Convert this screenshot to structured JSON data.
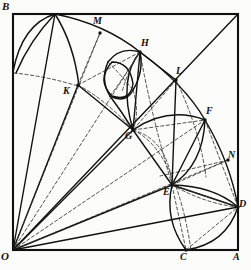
{
  "figure": {
    "background_color": "#fcfcfa",
    "stroke_color": "#111111",
    "dashed_color": "#333333",
    "square": {
      "origin_label": "O",
      "left": 13,
      "top": 14,
      "right": 238,
      "bottom": 250
    },
    "points": [
      {
        "id": "B",
        "label": "B",
        "x": 13,
        "y": 14,
        "lx": 2,
        "ly": 1,
        "size": 11
      },
      {
        "id": "M",
        "label": "M",
        "x": 100,
        "y": 33,
        "lx": 93,
        "ly": 16,
        "size": 10
      },
      {
        "id": "H",
        "label": "H",
        "x": 140,
        "y": 52,
        "lx": 141,
        "ly": 38,
        "size": 10
      },
      {
        "id": "L",
        "label": "L",
        "x": 176,
        "y": 80,
        "lx": 176,
        "ly": 66,
        "size": 10
      },
      {
        "id": "K",
        "label": "K",
        "x": 78,
        "y": 85,
        "lx": 63,
        "ly": 86,
        "size": 10
      },
      {
        "id": "F",
        "label": "F",
        "x": 205,
        "y": 120,
        "lx": 206,
        "ly": 106,
        "size": 10
      },
      {
        "id": "G",
        "label": "G",
        "x": 133,
        "y": 130,
        "lx": 125,
        "ly": 131,
        "size": 10
      },
      {
        "id": "N",
        "label": "N",
        "x": 228,
        "y": 160,
        "lx": 228,
        "ly": 150,
        "size": 10
      },
      {
        "id": "E",
        "label": "E",
        "x": 172,
        "y": 185,
        "lx": 163,
        "ly": 187,
        "size": 10
      },
      {
        "id": "D",
        "label": "D",
        "x": 238,
        "y": 207,
        "lx": 239,
        "ly": 199,
        "size": 10
      },
      {
        "id": "O",
        "label": "O",
        "x": 13,
        "y": 250,
        "lx": 1,
        "ly": 251,
        "size": 11
      },
      {
        "id": "C",
        "label": "C",
        "x": 186,
        "y": 250,
        "lx": 180,
        "ly": 252,
        "size": 10
      },
      {
        "id": "A",
        "label": "A",
        "x": 238,
        "y": 250,
        "lx": 233,
        "ly": 252,
        "size": 10
      }
    ],
    "rays_from_origin": [
      {
        "name": "ray-O-to-apex",
        "to_x": 55,
        "to_y": 14,
        "style": "solid"
      },
      {
        "name": "ray-O-to-K",
        "to_x": 78,
        "to_y": 85,
        "style": "solid"
      },
      {
        "name": "ray-O-to-M",
        "to_x": 100,
        "to_y": 33,
        "style": "dashed"
      },
      {
        "name": "ray-O-to-H",
        "to_x": 140,
        "to_y": 52,
        "style": "dashed"
      },
      {
        "name": "ray-O-to-G",
        "to_x": 133,
        "to_y": 130,
        "style": "solid"
      },
      {
        "name": "ray-O-to-corner",
        "to_x": 238,
        "to_y": 14,
        "style": "solid"
      },
      {
        "name": "ray-O-to-F",
        "to_x": 205,
        "to_y": 120,
        "style": "dashed"
      },
      {
        "name": "ray-O-to-E",
        "to_x": 172,
        "to_y": 185,
        "style": "solid"
      },
      {
        "name": "ray-O-to-N",
        "to_x": 228,
        "to_y": 160,
        "style": "dashed"
      },
      {
        "name": "ray-O-to-D",
        "to_x": 238,
        "to_y": 207,
        "style": "solid"
      }
    ],
    "chords": [
      {
        "name": "chord-K-G",
        "x1": 78,
        "y1": 85,
        "x2": 133,
        "y2": 130,
        "style": "solid"
      },
      {
        "name": "chord-G-E",
        "x1": 133,
        "y1": 130,
        "x2": 172,
        "y2": 185,
        "style": "solid"
      },
      {
        "name": "chord-E-D",
        "x1": 172,
        "y1": 185,
        "x2": 238,
        "y2": 207,
        "style": "solid"
      },
      {
        "name": "chord-G-H",
        "x1": 133,
        "y1": 130,
        "x2": 140,
        "y2": 52,
        "style": "solid"
      },
      {
        "name": "chord-G-F",
        "x1": 133,
        "y1": 130,
        "x2": 205,
        "y2": 120,
        "style": "dashed"
      },
      {
        "name": "chord-E-F",
        "x1": 172,
        "y1": 185,
        "x2": 205,
        "y2": 120,
        "style": "solid"
      },
      {
        "name": "chord-E-N",
        "x1": 172,
        "y1": 185,
        "x2": 228,
        "y2": 160,
        "style": "dashed"
      },
      {
        "name": "chord-E-C",
        "x1": 172,
        "y1": 185,
        "x2": 186,
        "y2": 250,
        "style": "dashed"
      },
      {
        "name": "chord-E-D2",
        "x1": 172,
        "y1": 185,
        "x2": 238,
        "y2": 207,
        "style": "dashed"
      },
      {
        "name": "chord-C-D",
        "x1": 186,
        "y1": 250,
        "x2": 238,
        "y2": 207,
        "style": "dashed"
      },
      {
        "name": "chord-K-H",
        "x1": 78,
        "y1": 85,
        "x2": 140,
        "y2": 52,
        "style": "dashed"
      },
      {
        "name": "chord-H-L",
        "x1": 140,
        "y1": 52,
        "x2": 176,
        "y2": 80,
        "style": "solid"
      },
      {
        "name": "chord-L-G",
        "x1": 176,
        "y1": 80,
        "x2": 133,
        "y2": 130,
        "style": "dashed"
      },
      {
        "name": "chord-L-E",
        "x1": 176,
        "y1": 80,
        "x2": 172,
        "y2": 185,
        "style": "solid"
      },
      {
        "name": "chord-F-D",
        "x1": 205,
        "y1": 120,
        "x2": 238,
        "y2": 207,
        "style": "dashed"
      },
      {
        "name": "chord-K-M",
        "x1": 78,
        "y1": 85,
        "x2": 100,
        "y2": 33,
        "style": "dashed"
      }
    ],
    "arcs": [
      {
        "name": "arc-apex-K",
        "d": "M 55 14 Q 30 40 16 73",
        "style": "solid"
      },
      {
        "name": "arc-top-apex",
        "d": "M 13 72 Q 22 24 55 14",
        "style": "solid"
      },
      {
        "name": "arc-apex-to-K2",
        "d": "M 55 14 Q 74 44 79 86",
        "style": "solid"
      },
      {
        "name": "arc-left-dash-K",
        "d": "M 14 73 Q 45 76 78 86",
        "style": "dashed"
      },
      {
        "name": "arc-apex-M-H",
        "d": "M 55 14 Q 105 24 140 52",
        "style": "solid"
      },
      {
        "name": "arc-K-G-dash",
        "d": "M 78 85 Q 106 100 133 130",
        "style": "dashed"
      },
      {
        "name": "arc-H-L-F",
        "d": "M 140 52 Q 185 85 205 120",
        "style": "solid"
      },
      {
        "name": "arc-F-N-D",
        "d": "M 205 120 Q 230 162 238 207",
        "style": "solid"
      },
      {
        "name": "arc-G-H-bulge",
        "d": "M 133 130 Q 118 78 140 52",
        "style": "solid"
      },
      {
        "name": "arc-G-F-bulge",
        "d": "M 133 130 Q 168 106 205 120",
        "style": "solid"
      },
      {
        "name": "arc-G-E-bulge",
        "d": "M 133 130 Q 168 140 172 185",
        "style": "dashed"
      },
      {
        "name": "arc-F-E-bulge",
        "d": "M 205 120 Q 203 165 172 185",
        "style": "solid"
      },
      {
        "name": "arc-E-D-bulge",
        "d": "M 172 185 Q 214 186 238 207",
        "style": "solid"
      },
      {
        "name": "arc-E-C-bulge",
        "d": "M 172 185 Q 164 220 186 250",
        "style": "solid"
      },
      {
        "name": "arc-C-D-bulge",
        "d": "M 186 250 Q 226 244 238 207",
        "style": "solid"
      },
      {
        "name": "arc-E-D-inner",
        "d": "M 172 185 Q 206 204 238 207",
        "style": "dashed"
      },
      {
        "name": "arc-G-long-dash",
        "d": "M 133 130 Q 176 150 191 250",
        "style": "dashed"
      },
      {
        "name": "arc-H-down-dash",
        "d": "M 140 52 Q 150 110 172 185",
        "style": "dashed"
      },
      {
        "name": "arc-L-down-dash",
        "d": "M 176 80 Q 200 130 206 177",
        "style": "dashed"
      },
      {
        "name": "arc-N-left-dash",
        "d": "M 228 160 Q 196 168 160 176",
        "style": "dashed"
      },
      {
        "name": "arc-sq1-top",
        "d": "M 108 62 Q 120 46 140 52",
        "style": "solid"
      },
      {
        "name": "arc-sq1-left",
        "d": "M 108 62 Q 100 80 110 96",
        "style": "solid"
      },
      {
        "name": "arc-sq1-bot",
        "d": "M 110 96 Q 126 104 133 90",
        "style": "solid"
      },
      {
        "name": "arc-sq1-right",
        "d": "M 133 90 Q 144 72 140 52",
        "style": "solid"
      },
      {
        "name": "arc-sq2",
        "d": "M 110 96 Q 122 112 133 130",
        "style": "solid"
      },
      {
        "name": "arc-sq2b",
        "d": "M 133 90 Q 140 112 133 130",
        "style": "dashed"
      },
      {
        "name": "arc-inner-circ",
        "d": "M 112 62 Q 96 80 112 96 Q 130 102 133 84 Q 130 62 112 62",
        "style": "solid"
      },
      {
        "name": "arc-H-to-sq",
        "d": "M 140 52 Q 128 70 122 92",
        "style": "dashed"
      },
      {
        "name": "arc-diag-sq1",
        "d": "M 108 62 Q 122 76 133 90",
        "style": "dashed"
      },
      {
        "name": "arc-diag-sq2",
        "d": "M 110 96 Q 126 74 140 52",
        "style": "dashed"
      }
    ]
  }
}
